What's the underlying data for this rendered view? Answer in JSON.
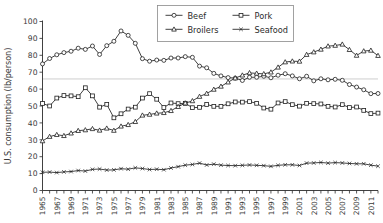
{
  "chart_data": {
    "type": "line",
    "title": "",
    "xlabel": "",
    "ylabel": "U.S. consumption (lb/person)",
    "xlim": [
      1965,
      2012
    ],
    "ylim": [
      0,
      100
    ],
    "ytick_step": 10,
    "yticks": [
      0,
      10,
      20,
      30,
      40,
      50,
      60,
      70,
      80,
      90,
      100
    ],
    "ytick_labels": [
      "0",
      "10",
      "20",
      "30",
      "40",
      "50",
      "60",
      "70",
      "80",
      "90",
      "100"
    ],
    "grid": false,
    "legend_position": "top-center",
    "reference_line": {
      "y": 66,
      "color": "#c9c9c9",
      "label": ""
    },
    "x": [
      1965,
      1966,
      1967,
      1968,
      1969,
      1970,
      1971,
      1972,
      1973,
      1974,
      1975,
      1976,
      1977,
      1978,
      1979,
      1980,
      1981,
      1982,
      1983,
      1984,
      1985,
      1986,
      1987,
      1988,
      1989,
      1990,
      1991,
      1992,
      1993,
      1994,
      1995,
      1996,
      1997,
      1998,
      1999,
      2000,
      2001,
      2002,
      2003,
      2004,
      2005,
      2006,
      2007,
      2008,
      2009,
      2010,
      2011,
      2012
    ],
    "xtick_labels": [
      "1965",
      "",
      "1967",
      "",
      "1969",
      "",
      "1971",
      "",
      "1973",
      "",
      "1975",
      "",
      "1977",
      "",
      "1979",
      "",
      "1981",
      "",
      "1983",
      "",
      "1985",
      "",
      "1987",
      "",
      "1989",
      "",
      "1991",
      "",
      "1993",
      "",
      "1995",
      "",
      "1997",
      "",
      "1999",
      "",
      "2001",
      "",
      "2003",
      "",
      "2005",
      "",
      "2007",
      "",
      "2009",
      "",
      "2011",
      ""
    ],
    "series": [
      {
        "name": "Beef",
        "marker": "circle",
        "values": [
          74.9,
          78.1,
          80.3,
          81.6,
          82.4,
          84.2,
          83.5,
          85.5,
          80.5,
          85.7,
          88.3,
          94.4,
          91.8,
          87.1,
          78.0,
          76.5,
          77.2,
          77.0,
          78.4,
          78.4,
          79.2,
          78.8,
          73.6,
          72.6,
          69.3,
          67.8,
          66.8,
          66.5,
          65.1,
          67.0,
          67.0,
          67.6,
          66.7,
          68.2,
          69.1,
          67.8,
          66.1,
          67.6,
          64.9,
          66.1,
          65.5,
          65.8,
          65.2,
          62.7,
          61.2,
          59.6,
          57.3,
          57.4
        ]
      },
      {
        "name": "Pork",
        "marker": "square",
        "values": [
          51.5,
          50.0,
          54.7,
          56.2,
          56.0,
          55.5,
          60.8,
          56.0,
          49.3,
          51.0,
          43.0,
          45.4,
          48.2,
          49.3,
          54.7,
          57.3,
          54.0,
          49.1,
          51.8,
          51.4,
          51.6,
          49.0,
          49.2,
          50.9,
          49.8,
          49.8,
          51.3,
          52.4,
          52.3,
          52.6,
          51.6,
          48.8,
          48.1,
          51.8,
          52.6,
          50.8,
          49.9,
          51.6,
          51.4,
          51.2,
          49.8,
          49.4,
          50.8,
          49.1,
          49.4,
          47.4,
          45.5,
          45.8
        ]
      },
      {
        "name": "Broilers",
        "marker": "triangle",
        "values": [
          29.3,
          31.9,
          33.0,
          32.4,
          33.9,
          35.4,
          35.8,
          36.5,
          35.6,
          36.8,
          35.5,
          38.0,
          38.9,
          40.7,
          44.5,
          45.0,
          45.7,
          46.0,
          47.2,
          49.6,
          51.7,
          53.0,
          55.6,
          57.4,
          59.8,
          61.6,
          64.1,
          66.5,
          68.2,
          69.6,
          69.3,
          69.0,
          70.0,
          72.9,
          76.0,
          76.5,
          76.4,
          80.4,
          81.9,
          83.5,
          85.4,
          85.8,
          86.5,
          83.3,
          79.9,
          82.5,
          82.9,
          79.8
        ]
      },
      {
        "name": "Seafood",
        "marker": "x",
        "values": [
          10.8,
          10.9,
          10.6,
          11.0,
          11.2,
          11.8,
          11.5,
          12.5,
          12.7,
          12.1,
          12.2,
          12.9,
          12.6,
          13.4,
          13.0,
          12.4,
          12.6,
          12.3,
          13.3,
          14.1,
          15.0,
          15.4,
          16.2,
          15.1,
          15.6,
          15.0,
          14.8,
          14.7,
          14.9,
          15.1,
          14.9,
          14.7,
          14.3,
          14.9,
          15.2,
          15.2,
          14.8,
          16.2,
          16.3,
          16.6,
          16.2,
          16.5,
          16.3,
          16.0,
          15.8,
          15.8,
          15.0,
          14.4
        ]
      }
    ]
  },
  "legend": {
    "entries": [
      {
        "label": "Beef",
        "marker": "circle"
      },
      {
        "label": "Pork",
        "marker": "square"
      },
      {
        "label": "Broilers",
        "marker": "triangle"
      },
      {
        "label": "Seafood",
        "marker": "x"
      }
    ]
  }
}
